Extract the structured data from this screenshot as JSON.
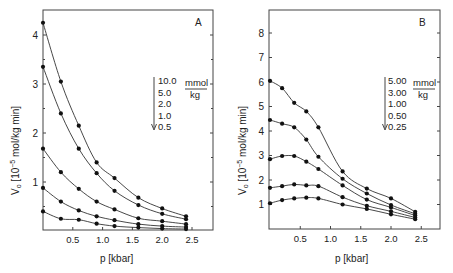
{
  "chart_data": [
    {
      "type": "line",
      "panel_label": "A",
      "title": "",
      "xlabel": "p [kbar]",
      "ylabel": "V₀ [10⁻⁵ mol/kg min]",
      "xlim": [
        0,
        2.8
      ],
      "ylim": [
        0,
        4.5
      ],
      "x_ticks": [
        "0.5",
        "1.0",
        "1.5",
        "2.0",
        "2.5"
      ],
      "y_ticks": [
        "1",
        "2",
        "3",
        "4"
      ],
      "grid": false,
      "legend": {
        "entries": [
          "10.0",
          "5.0",
          "2.0",
          "1.0",
          "0.5"
        ],
        "unit_numerator": "mmol",
        "unit_denominator": "kg",
        "position": "right-middle",
        "arrow": "down"
      },
      "x": [
        0,
        0.3,
        0.6,
        0.9,
        1.2,
        1.6,
        2.0,
        2.4
      ],
      "series": [
        {
          "name": "10.0 mmol/kg",
          "values": [
            4.25,
            3.05,
            2.15,
            1.4,
            1.08,
            0.68,
            0.46,
            0.3
          ]
        },
        {
          "name": "5.0 mmol/kg",
          "values": [
            3.35,
            2.4,
            1.68,
            1.18,
            0.82,
            0.53,
            0.35,
            0.24
          ]
        },
        {
          "name": "2.0 mmol/kg",
          "values": [
            1.68,
            1.2,
            0.86,
            0.6,
            0.44,
            0.26,
            0.2,
            0.14
          ]
        },
        {
          "name": "1.0 mmol/kg",
          "values": [
            0.88,
            0.6,
            0.42,
            0.3,
            0.22,
            0.14,
            0.1,
            0.08
          ]
        },
        {
          "name": "0.5 mmol/kg",
          "values": [
            0.4,
            0.25,
            0.23,
            0.15,
            0.1,
            0.07,
            0.05,
            0.04
          ]
        }
      ]
    },
    {
      "type": "line",
      "panel_label": "B",
      "title": "",
      "xlabel": "p [kbar]",
      "ylabel": "V₀ [10⁻⁵ mol/kg min]",
      "xlim": [
        0,
        2.8
      ],
      "ylim": [
        0,
        9
      ],
      "x_ticks": [
        "0.5",
        "1.0",
        "1.5",
        "2.0",
        "2.5"
      ],
      "y_ticks": [
        "1",
        "2",
        "3",
        "4",
        "5",
        "6",
        "7",
        "8"
      ],
      "grid": false,
      "legend": {
        "entries": [
          "5.00",
          "3.00",
          "1.00",
          "0.50",
          "0.25"
        ],
        "unit_numerator": "mmol",
        "unit_denominator": "kg",
        "position": "right-middle",
        "arrow": "down"
      },
      "x": [
        0,
        0.2,
        0.4,
        0.6,
        0.8,
        1.2,
        1.6,
        2.0,
        2.4
      ],
      "series": [
        {
          "name": "5.00 mmol/kg",
          "values": [
            6.05,
            5.75,
            5.15,
            4.8,
            4.15,
            2.35,
            1.65,
            1.25,
            0.7
          ]
        },
        {
          "name": "3.00 mmol/kg",
          "values": [
            4.45,
            4.3,
            4.15,
            3.65,
            2.95,
            2.05,
            1.45,
            0.98,
            0.62
          ]
        },
        {
          "name": "1.00 mmol/kg",
          "values": [
            2.85,
            2.98,
            2.98,
            2.75,
            2.45,
            1.78,
            1.2,
            0.88,
            0.55
          ]
        },
        {
          "name": "0.50 mmol/kg",
          "values": [
            1.68,
            1.75,
            1.82,
            1.78,
            1.75,
            1.3,
            0.95,
            0.72,
            0.47
          ]
        },
        {
          "name": "0.25 mmol/kg",
          "values": [
            1.05,
            1.18,
            1.25,
            1.28,
            1.25,
            1.0,
            0.82,
            0.6,
            0.4
          ]
        }
      ]
    }
  ],
  "panels": {
    "a": {
      "label": "A",
      "xlabel": "p [kbar]",
      "ylabel_main": "V",
      "ylabel_sub": "o",
      "ylabel_rest": " [10",
      "ylabel_exp": "−5",
      "ylabel_tail": " mol/kg min]",
      "legend_unit_top": "mmol",
      "legend_unit_bottom": "kg"
    },
    "b": {
      "label": "B",
      "xlabel": "p [kbar]",
      "ylabel_main": "V",
      "ylabel_sub": "o",
      "ylabel_rest": " [10",
      "ylabel_exp": "−5",
      "ylabel_tail": " mol/kg min]",
      "legend_unit_top": "mmol",
      "legend_unit_bottom": "kg"
    }
  }
}
